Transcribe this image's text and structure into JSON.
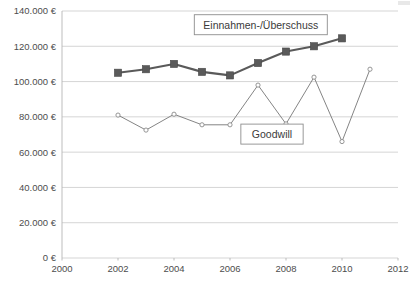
{
  "chart_data": {
    "type": "line",
    "title": "",
    "xlabel": "",
    "ylabel": "",
    "x": [
      2002,
      2003,
      2004,
      2005,
      2006,
      2007,
      2008,
      2009,
      2010,
      2011
    ],
    "xlim": [
      2000,
      2012
    ],
    "ylim": [
      0,
      140000
    ],
    "grid": true,
    "legend_position": "inline-annotation",
    "xticks": [
      "2000",
      "2002",
      "2004",
      "2006",
      "2008",
      "2010",
      "2012"
    ],
    "xtick_values": [
      2000,
      2002,
      2004,
      2006,
      2008,
      2010,
      2012
    ],
    "yticks": [
      "0 €",
      "20.000 €",
      "40.000 €",
      "60.000 €",
      "80.000 €",
      "100.000 €",
      "120.000 €",
      "140.000 €"
    ],
    "ytick_values": [
      0,
      20000,
      40000,
      60000,
      80000,
      100000,
      120000,
      140000
    ],
    "series": [
      {
        "name": "Einnahmen-/Überschuss",
        "marker": "square-filled",
        "color": "#5a5a5a",
        "x": [
          2002,
          2003,
          2004,
          2005,
          2006,
          2007,
          2008,
          2009,
          2010
        ],
        "values": [
          105000,
          107000,
          110000,
          105500,
          103500,
          110500,
          117000,
          120000,
          124500
        ]
      },
      {
        "name": "Goodwill",
        "marker": "circle-open",
        "color": "#7d7d7d",
        "x": [
          2002,
          2003,
          2004,
          2005,
          2006,
          2007,
          2008,
          2009,
          2010,
          2011
        ],
        "values": [
          81000,
          72500,
          81500,
          75500,
          75500,
          98000,
          76000,
          102500,
          66000,
          107000
        ]
      }
    ],
    "annotations": [
      {
        "label": "Einnahmen-/Überschuss",
        "x_value": 2007.1,
        "y_value": 132000,
        "boxed": true
      },
      {
        "label": "Goodwill",
        "x_value": 2007.5,
        "y_value": 70000,
        "boxed": true
      }
    ]
  },
  "axes": {
    "y_labels": [
      "140.000 €",
      "120.000 €",
      "100.000 €",
      "80.000 €",
      "60.000 €",
      "40.000 €",
      "20.000 €",
      "0 €"
    ],
    "x_labels": [
      "2000",
      "2002",
      "2004",
      "2006",
      "2008",
      "2010",
      "2012"
    ]
  },
  "legend": {
    "income_label": "Einnahmen-/Überschuss",
    "goodwill_label": "Goodwill"
  },
  "colors": {
    "income_series": "#5a5a5a",
    "goodwill_series": "#7d7d7d",
    "gridline": "#d0d0d0",
    "axis": "#b5b5b5",
    "tick_text": "#4d4d4d",
    "background": "#ffffff"
  }
}
